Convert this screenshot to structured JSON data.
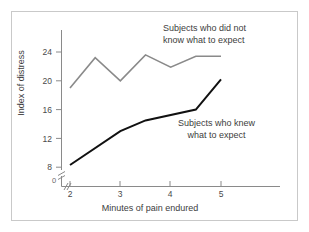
{
  "figure": {
    "border_color": "#c9c9c9",
    "background": "#ffffff"
  },
  "chart_data": {
    "type": "line",
    "title": "",
    "xlabel": "Minutes of pain endured",
    "ylabel": "Index of distress",
    "x": [
      2,
      2.5,
      3,
      3.5,
      4,
      4.5,
      5
    ],
    "xlim": [
      1.75,
      5.1
    ],
    "ylim": [
      6.5,
      25.5
    ],
    "xticks": [
      2,
      3,
      4,
      5
    ],
    "xtick_labels": [
      "2",
      "3",
      "4",
      "5"
    ],
    "yticks": [
      8,
      12,
      16,
      20,
      24
    ],
    "ytick_labels": [
      "8",
      "12",
      "16",
      "20",
      "24"
    ],
    "grid": false,
    "legend_position": "inline-annotations",
    "axis_break": {
      "x_axis": true,
      "y_axis": true,
      "origin_label": "0"
    },
    "series": [
      {
        "name": "Subjects who did not know what to expect",
        "color": "#8a8a8a",
        "linewidth": 1.6,
        "x": [
          2,
          2.5,
          3,
          3.5,
          4,
          4.5,
          5
        ],
        "values": [
          19.0,
          23.2,
          20.0,
          23.6,
          21.9,
          23.4,
          23.4
        ]
      },
      {
        "name": "Subjects who knew what to expect",
        "color": "#111111",
        "linewidth": 2.0,
        "x": [
          2,
          3,
          3.5,
          4.5,
          5
        ],
        "values": [
          8.3,
          13.0,
          14.5,
          16.0,
          20.2
        ]
      }
    ],
    "annotations": [
      {
        "id": "gray-series-annotation",
        "line1": "Subjects who did not",
        "line2": "know what to expect",
        "series": "Subjects who did not know what to expect"
      },
      {
        "id": "black-series-annotation",
        "line1": "Subjects who knew",
        "line2": "what to expect",
        "series": "Subjects who knew what to expect"
      }
    ]
  },
  "axis": {
    "origin_label": "0"
  }
}
